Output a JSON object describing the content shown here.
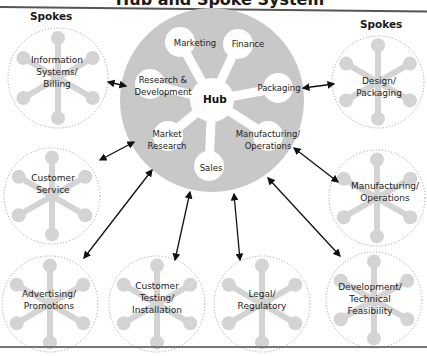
{
  "title": "Hub and Spoke System",
  "spokes_heading_left": "Spokes",
  "spokes_heading_right": "Spokes",
  "hub": {
    "center_label": "Hub",
    "functions": [
      {
        "id": "marketing",
        "label": "Marketing"
      },
      {
        "id": "finance",
        "label": "Finance"
      },
      {
        "id": "packaging",
        "label": "Packaging"
      },
      {
        "id": "manufacturing",
        "label": "Manufacturing/\nOperations"
      },
      {
        "id": "sales",
        "label": "Sales"
      },
      {
        "id": "market-research",
        "label": "Market\nResearch"
      },
      {
        "id": "research-development",
        "label": "Research &\nDevelopment"
      }
    ]
  },
  "spokes": [
    {
      "id": "information-systems",
      "label": "Information\nSystems/\nBilling"
    },
    {
      "id": "customer-service",
      "label": "Customer\nService"
    },
    {
      "id": "advertising",
      "label": "Advertising/\nPromotions"
    },
    {
      "id": "customer-testing",
      "label": "Customer\nTesting/\nInstallation"
    },
    {
      "id": "legal",
      "label": "Legal/\nRegulatory"
    },
    {
      "id": "development-technical",
      "label": "Development/\nTechnical\nFeasibility"
    },
    {
      "id": "manufacturing-operations",
      "label": "Manufacturing/\nOperations"
    },
    {
      "id": "design-packaging",
      "label": "Design/\nPackaging"
    }
  ],
  "colors": {
    "hub_fill": "#c8c8c8",
    "spoke_fill": "#d4d4d4",
    "arrow": "#111111",
    "dotted_border": "#9a9a9a"
  }
}
